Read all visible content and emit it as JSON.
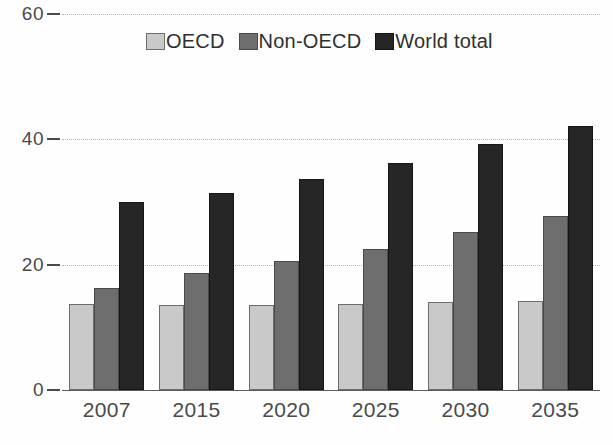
{
  "chart_data": {
    "type": "bar",
    "title": "",
    "subtitle": "",
    "xlabel": "",
    "ylabel": "",
    "categories": [
      "2007",
      "2015",
      "2020",
      "2025",
      "2030",
      "2035"
    ],
    "series": [
      {
        "name": "OECD",
        "color": "#c9c9c9",
        "values": [
          13.8,
          13.6,
          13.6,
          13.8,
          14.0,
          14.2
        ]
      },
      {
        "name": "Non-OECD",
        "color": "#6e6e6e",
        "values": [
          16.3,
          18.6,
          20.6,
          22.5,
          25.2,
          27.8
        ]
      },
      {
        "name": "World total",
        "color": "#262626",
        "values": [
          30.0,
          31.4,
          33.6,
          36.3,
          39.2,
          42.2
        ]
      }
    ],
    "ylim": [
      0,
      60
    ],
    "yticks": [
      0,
      20,
      40,
      60
    ],
    "ytick_labels": [
      "0",
      "20",
      "40",
      "60"
    ],
    "grid": true,
    "grid_axis": "y",
    "grid_style": "dotted",
    "legend": true,
    "legend_position": "top-center"
  },
  "legend": {
    "items": [
      {
        "label": "OECD",
        "swatch": "legend-swatch-oecd"
      },
      {
        "label": "Non-OECD",
        "swatch": "legend-swatch-non-oecd"
      },
      {
        "label": "World total",
        "swatch": "legend-swatch-world-total"
      }
    ]
  },
  "axes": {
    "y_tick_labels": [
      "60",
      "40",
      "20",
      "0"
    ],
    "x_tick_labels": [
      "2007",
      "2015",
      "2020",
      "2025",
      "2030",
      "2035"
    ]
  }
}
